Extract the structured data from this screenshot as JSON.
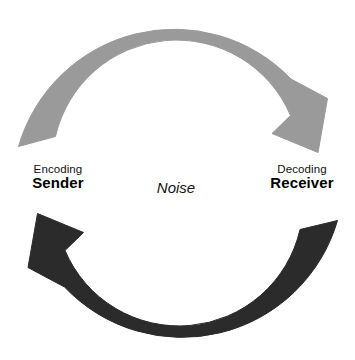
{
  "diagram": {
    "title_present": false,
    "background_color": "#ffffff",
    "labels": {
      "left": {
        "process": "Encoding",
        "role": "Sender"
      },
      "center": {
        "text": "Noise"
      },
      "right": {
        "process": "Decoding",
        "role": "Receiver"
      }
    },
    "arrows": [
      {
        "name": "sender-to-receiver-arrow",
        "color": "#9a9a9a",
        "direction": "clockwise-top",
        "from": "Sender",
        "to": "Receiver"
      },
      {
        "name": "receiver-to-sender-arrow",
        "color": "#2b2b2b",
        "direction": "clockwise-bottom",
        "from": "Receiver",
        "to": "Sender"
      }
    ]
  }
}
